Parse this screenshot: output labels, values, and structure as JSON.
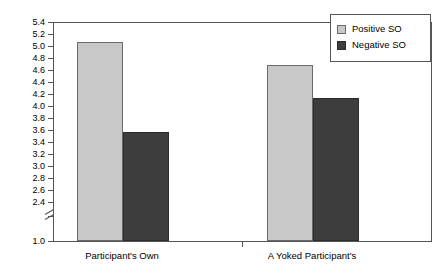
{
  "chart_data": {
    "type": "bar",
    "title": "",
    "subtitle": "",
    "xlabel": "",
    "ylabel": "",
    "categories": [
      "Participant's Own",
      "A Yoked Participant's"
    ],
    "series": [
      {
        "name": "Positive SO",
        "color": "#c8c8c8",
        "values": [
          5.05,
          4.67
        ]
      },
      {
        "name": "Negative SO",
        "color": "#3d3d3d",
        "values": [
          3.55,
          4.12
        ]
      }
    ],
    "ylim": [
      2.4,
      5.4
    ],
    "y_axis_break": true,
    "y_axis_base_label": "1.0",
    "yticks": [
      "5.4",
      "5.2",
      "5.0",
      "4.8",
      "4.6",
      "4.4",
      "4.2",
      "4.0",
      "3.8",
      "3.6",
      "3.4",
      "3.2",
      "3.0",
      "2.8",
      "2.6",
      "2.4"
    ],
    "ytick_values": [
      5.4,
      5.2,
      5.0,
      4.8,
      4.6,
      4.4,
      4.2,
      4.0,
      3.8,
      3.6,
      3.4,
      3.2,
      3.0,
      2.8,
      2.6,
      2.4
    ],
    "grid": false,
    "legend_position": "top-right",
    "legend": [
      "Positive SO",
      "Negative SO"
    ]
  },
  "legend": {
    "items": [
      {
        "label": "Positive SO"
      },
      {
        "label": "Negative SO"
      }
    ]
  },
  "axis": {
    "y_labels": [
      "5.4",
      "5.2",
      "5.0",
      "4.8",
      "4.6",
      "4.4",
      "4.2",
      "4.0",
      "3.8",
      "3.6",
      "3.4",
      "3.2",
      "3.0",
      "2.8",
      "2.6",
      "2.4"
    ],
    "y_base_label": "1.0",
    "x_labels": [
      "Participant's Own",
      "A Yoked Participant's"
    ]
  }
}
